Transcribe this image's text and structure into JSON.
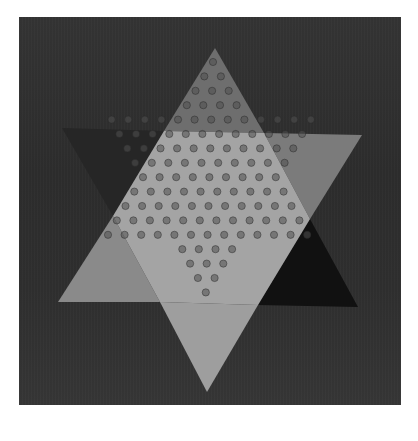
{
  "image": {
    "subject": "Chinese checkers board",
    "description": "Grayscale photograph of a six-pointed star Chinese checkers board with holes, on a dark background",
    "frame": {
      "x": 19,
      "y": 17,
      "width": 382,
      "height": 388
    },
    "colors": {
      "page": "#ffffff",
      "background": "#2f2f2f",
      "center_hexagon": "#a4a4a4",
      "top_point": "#6e6e6e",
      "upper_left_point": "#262626",
      "upper_right_point": "#7b7b7b",
      "lower_left_point": "#8a8a8a",
      "lower_right_point": "#111111",
      "bottom_point": "#9e9e9e",
      "hole": "#6a6a6a"
    },
    "star": {
      "top_vertex": [
        215,
        48
      ],
      "bottom_vertex": [
        207,
        392
      ],
      "upper_triangle_left": [
        62,
        128
      ],
      "upper_triangle_right": [
        362,
        135
      ],
      "lower_triangle_left": [
        58,
        302
      ],
      "lower_triangle_right": [
        358,
        307
      ]
    }
  }
}
